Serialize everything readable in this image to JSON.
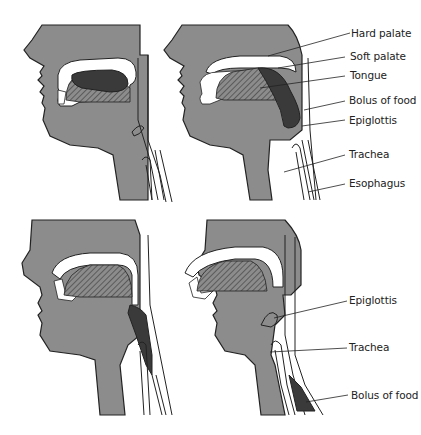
{
  "figure": {
    "colors": {
      "tissue": "#8c8c8c",
      "bolus": "#3a3a3a",
      "outline": "#222222",
      "background": "#ffffff"
    },
    "panels": [
      {
        "id": "top-left",
        "stage": 1
      },
      {
        "id": "top-right",
        "stage": 2
      },
      {
        "id": "bottom-left",
        "stage": 3
      },
      {
        "id": "bottom-right",
        "stage": 4
      }
    ],
    "top_labels": [
      {
        "text": "Hard palate"
      },
      {
        "text": "Soft palate"
      },
      {
        "text": "Tongue"
      },
      {
        "text": "Bolus of food"
      },
      {
        "text": "Epiglottis"
      },
      {
        "text": "Trachea"
      },
      {
        "text": "Esophagus"
      }
    ],
    "bottom_labels": [
      {
        "text": "Epiglottis"
      },
      {
        "text": "Trachea"
      },
      {
        "text": "Bolus of food"
      }
    ]
  }
}
